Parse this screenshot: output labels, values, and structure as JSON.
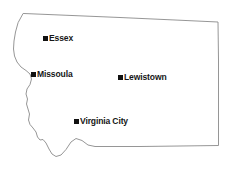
{
  "map": {
    "title": "Montana",
    "region_name": "Montana",
    "background_color": "#ffffff",
    "outline_color": "#8a8a8a",
    "outline_fill": "#ffffff",
    "marker_color": "#111111",
    "label_color": "#161616",
    "width": 249,
    "height": 183,
    "outline_path": "M 23.5 13.5 L 60 15 L 120 17.5 L 175 20 L 218 22 L 218.5 60 L 218.5 100 L 218.5 145.5 L 180 146 L 140 146.5 L 110 146.5 L 95 146.5 L 88 145 L 82 140.5 L 76 138.5 L 71 142 L 66 149.5 L 61 155 L 56 156.5 L 52 154 L 49 149 L 46 143 L 43 139.5 L 40 140 L 37.5 137 L 36 132 L 33 128 L 30 124.5 L 28.5 120 L 29.5 114 L 28 109 L 26.5 104 L 27.5 99 L 26 94 L 27 89 L 30 84.5 L 31.5 79 L 30 74 L 26 70.5 L 21 67 L 17 62 L 14.5 56 L 13.5 49 L 14 41 L 15.5 32 L 18 23 Z",
    "cities": [
      {
        "name": "Essex",
        "x": 45,
        "y": 38,
        "label": "Essex"
      },
      {
        "name": "Missoula",
        "x": 33,
        "y": 74,
        "label": "Missoula"
      },
      {
        "name": "Lewistown",
        "x": 120,
        "y": 77,
        "label": "Lewistown"
      },
      {
        "name": "Virginia City",
        "x": 76,
        "y": 121,
        "label": "Virginia City"
      }
    ]
  },
  "chart_data": {
    "type": "map",
    "xlabel": "",
    "ylabel": "",
    "points": [
      {
        "label": "Essex",
        "x": 45,
        "y": 38
      },
      {
        "label": "Missoula",
        "x": 33,
        "y": 74
      },
      {
        "label": "Lewistown",
        "x": 120,
        "y": 77
      },
      {
        "label": "Virginia City",
        "x": 76,
        "y": 121
      }
    ]
  }
}
